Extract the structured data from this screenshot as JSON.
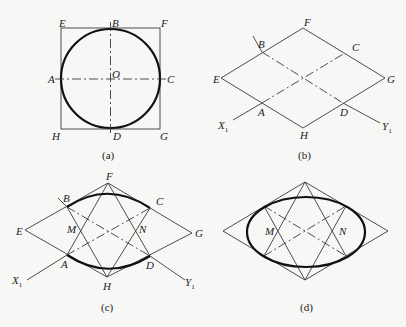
{
  "figure": {
    "panels": [
      {
        "id": "a",
        "caption": "(a)",
        "description": "Circle inscribed in square EFGH with center O and centerlines through A-C and B-D",
        "labels": {
          "E": "E",
          "F": "F",
          "G": "G",
          "H": "H",
          "A": "A",
          "B": "B",
          "C": "C",
          "D": "D",
          "O": "O"
        }
      },
      {
        "id": "b",
        "caption": "(b)",
        "description": "Isometric rhombus EFGH with axes X1 and Y1 through tangent points A, B, C, D",
        "labels": {
          "E": "E",
          "F": "F",
          "G": "G",
          "H": "H",
          "A": "A",
          "B": "B",
          "C": "C",
          "D": "D",
          "X": "X",
          "Y": "Y",
          "sub": "1"
        }
      },
      {
        "id": "c",
        "caption": "(c)",
        "description": "Rhombus with lines from F and H to tangent points, centers M and N, and major arcs drawn",
        "labels": {
          "E": "E",
          "F": "F",
          "G": "G",
          "H": "H",
          "A": "A",
          "B": "B",
          "C": "C",
          "D": "D",
          "M": "M",
          "N": "N",
          "X": "X",
          "Y": "Y",
          "sub": "1"
        }
      },
      {
        "id": "d",
        "caption": "(d)",
        "description": "Completed approximate isometric ellipse within rhombus using four-center method",
        "labels": {
          "M": "M",
          "N": "N"
        }
      }
    ]
  }
}
